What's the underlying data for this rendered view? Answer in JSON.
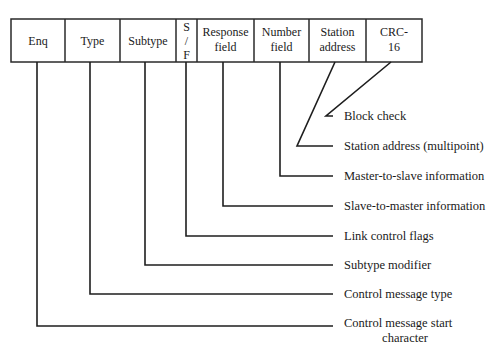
{
  "diagram": {
    "title": "",
    "frame": {
      "fields": [
        {
          "name": "enq",
          "lines": [
            "Enq"
          ]
        },
        {
          "name": "type",
          "lines": [
            "Type"
          ]
        },
        {
          "name": "subtype",
          "lines": [
            "Subtype"
          ]
        },
        {
          "name": "sf",
          "lines": [
            "S",
            "/",
            "F"
          ]
        },
        {
          "name": "response-field",
          "lines": [
            "Response",
            "field"
          ]
        },
        {
          "name": "number-field",
          "lines": [
            "Number",
            "field"
          ]
        },
        {
          "name": "station-address",
          "lines": [
            "Station",
            "address"
          ]
        },
        {
          "name": "crc-16",
          "lines": [
            "CRC-",
            "16"
          ]
        }
      ]
    },
    "annotations": [
      {
        "name": "block-check",
        "lines": [
          "Block check"
        ],
        "points_to": "CRC-16"
      },
      {
        "name": "station-address-multipoint",
        "lines": [
          "Station address (multipoint)"
        ],
        "points_to": "Station address"
      },
      {
        "name": "master-to-slave-information",
        "lines": [
          "Master-to-slave information"
        ],
        "points_to": "Number field"
      },
      {
        "name": "slave-to-master-information",
        "lines": [
          "Slave-to-master information"
        ],
        "points_to": "Response field"
      },
      {
        "name": "link-control-flags",
        "lines": [
          "Link control flags"
        ],
        "points_to": "S/F"
      },
      {
        "name": "subtype-modifier",
        "lines": [
          "Subtype modifier"
        ],
        "points_to": "Subtype"
      },
      {
        "name": "control-message-type",
        "lines": [
          "Control message type"
        ],
        "points_to": "Type"
      },
      {
        "name": "control-message-start-character",
        "lines": [
          "Control message start",
          "character"
        ],
        "points_to": "Enq"
      }
    ]
  }
}
